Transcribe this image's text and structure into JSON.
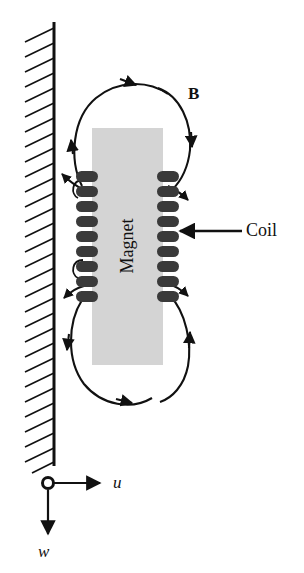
{
  "figure": {
    "background_color": "#ffffff",
    "ink_color": "#111111",
    "magnet": {
      "label": "Magnet",
      "fill_color": "#d3d3d3",
      "orientation": "vertical",
      "label_rotation_deg": -90
    },
    "coil": {
      "label": "Coil",
      "winding_color": "#2b2b2b",
      "winding_count_per_side": 8
    },
    "field": {
      "label": "B",
      "description": "magnetic flux lines looping above and below the magnet"
    },
    "wall": {
      "name": "fixed-wall",
      "hatch_count": 30,
      "hatch_direction": "down-left"
    },
    "axes": {
      "origin_marker": "open-circle",
      "horizontal": {
        "label": "u",
        "direction": "right"
      },
      "vertical": {
        "label": "w",
        "direction": "down"
      }
    }
  }
}
